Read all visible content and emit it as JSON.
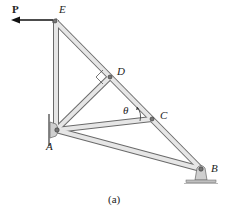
{
  "diagram": {
    "type": "truss",
    "caption": "(a)",
    "load": {
      "label": "P",
      "direction": "left",
      "applied_at": "E"
    },
    "angle_label": "θ",
    "nodes": [
      {
        "id": "E",
        "label": "E",
        "x": 54,
        "y": 20
      },
      {
        "id": "D",
        "label": "D",
        "x": 110,
        "y": 77
      },
      {
        "id": "C",
        "label": "C",
        "x": 152,
        "y": 119
      },
      {
        "id": "A",
        "label": "A",
        "x": 56,
        "y": 130
      },
      {
        "id": "B",
        "label": "B",
        "x": 201,
        "y": 169
      }
    ],
    "members": [
      [
        "E",
        "A"
      ],
      [
        "E",
        "D"
      ],
      [
        "D",
        "C"
      ],
      [
        "C",
        "B"
      ],
      [
        "A",
        "D"
      ],
      [
        "A",
        "C"
      ],
      [
        "A",
        "B"
      ]
    ],
    "supports": [
      {
        "node": "A",
        "type": "pin-wall"
      },
      {
        "node": "B",
        "type": "pin-ground"
      }
    ],
    "colors": {
      "member_fill": "#e4e4e4",
      "member_edge": "#6a6a6a",
      "support": "#cfcfcf",
      "load_arrow": "#111111"
    }
  }
}
